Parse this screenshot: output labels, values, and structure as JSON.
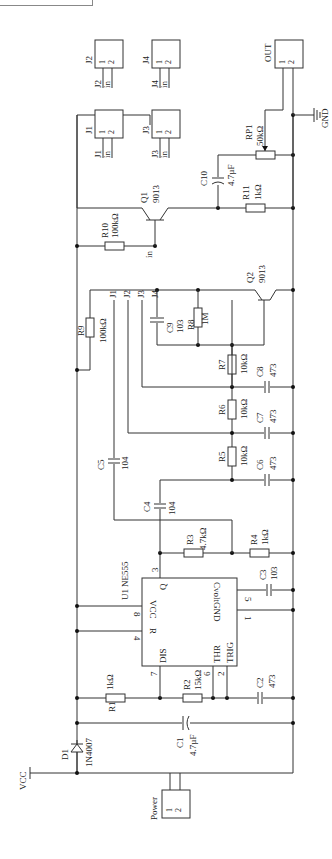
{
  "diagram": {
    "top_box_label": "",
    "power": {
      "label": "Power",
      "pins": [
        "1",
        "2"
      ]
    },
    "vcc": {
      "label": "VCC"
    },
    "gnd": {
      "label": "GND"
    },
    "output": {
      "label": "OUT",
      "pins": [
        "1",
        "2"
      ]
    },
    "ic": {
      "ref": "U1",
      "part": "NE555",
      "pins": {
        "vcc": {
          "name": "VCC",
          "num": "8"
        },
        "reset": {
          "name": "R",
          "num": "4"
        },
        "dis": {
          "name": "DIS",
          "num": "7"
        },
        "thr": {
          "name": "THR",
          "num": "6"
        },
        "trig": {
          "name": "TRIG",
          "num": "2"
        },
        "q": {
          "name": "Q",
          "num": "3"
        },
        "cvolt": {
          "name": "Cvolt",
          "num": "5"
        },
        "gnd": {
          "name": "GND",
          "num": "1"
        }
      }
    },
    "components": {
      "D1": {
        "ref": "D1",
        "value": "1N4007"
      },
      "C1": {
        "ref": "C1",
        "value": "4.7µF"
      },
      "R1": {
        "ref": "R1",
        "value": "1kΩ"
      },
      "R2": {
        "ref": "R2",
        "value": "15kΩ"
      },
      "C2": {
        "ref": "C2",
        "value": "473"
      },
      "C3": {
        "ref": "C3",
        "value": "103"
      },
      "R3": {
        "ref": "R3",
        "value": "4.7kΩ"
      },
      "R4": {
        "ref": "R4",
        "value": "1kΩ"
      },
      "C4": {
        "ref": "C4",
        "value": "104"
      },
      "C5": {
        "ref": "C5",
        "value": "104"
      },
      "R5": {
        "ref": "R5",
        "value": "10kΩ"
      },
      "C6": {
        "ref": "C6",
        "value": "473"
      },
      "R6": {
        "ref": "R6",
        "value": "10kΩ"
      },
      "C7": {
        "ref": "C7",
        "value": "473"
      },
      "R7": {
        "ref": "R7",
        "value": "10kΩ"
      },
      "C8": {
        "ref": "C8",
        "value": "473"
      },
      "C9": {
        "ref": "C9",
        "value": "103"
      },
      "R8": {
        "ref": "R8",
        "value": "1M"
      },
      "Q2": {
        "ref": "Q2",
        "value": "9013"
      },
      "R9": {
        "ref": "R9",
        "value": "100kΩ"
      },
      "R10": {
        "ref": "R10",
        "value": "100kΩ"
      },
      "Q1": {
        "ref": "Q1",
        "value": "9013"
      },
      "C10": {
        "ref": "C10",
        "value": "4.7µF"
      },
      "R11": {
        "ref": "R11",
        "value": "1kΩ"
      },
      "RP1": {
        "ref": "RP1",
        "value": "50kΩ"
      }
    },
    "net_labels": {
      "J1": "J1",
      "J2": "J2",
      "J3": "J3",
      "J4": "J4",
      "in": "in"
    },
    "connectors": [
      {
        "ref": "J1",
        "pins": [
          "1",
          "2"
        ],
        "net1": "J1",
        "net2": "in"
      },
      {
        "ref": "J2",
        "pins": [
          "1",
          "2"
        ],
        "net1": "J2",
        "net2": "in"
      },
      {
        "ref": "J3",
        "pins": [
          "1",
          "2"
        ],
        "net1": "J3",
        "net2": "in"
      },
      {
        "ref": "J4",
        "pins": [
          "1",
          "2"
        ],
        "net1": "J4",
        "net2": "in"
      }
    ]
  }
}
